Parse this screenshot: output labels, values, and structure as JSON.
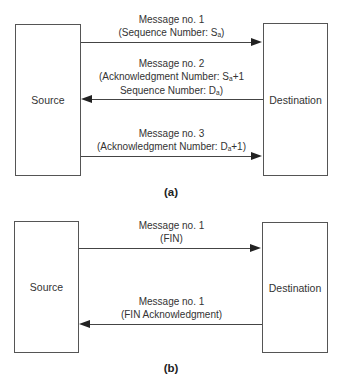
{
  "diagram_a": {
    "source_label": "Source",
    "destination_label": "Destination",
    "caption": "(a)",
    "messages": [
      {
        "direction": "source-to-destination",
        "title": "Message no. 1",
        "line2_prefix": "(Sequence Number: S",
        "line2_sub": "a",
        "line2_suffix": ")"
      },
      {
        "direction": "destination-to-source",
        "title": "Message no. 2",
        "line2_prefix": "(Acknowledgment Number: S",
        "line2_sub": "a",
        "line2_suffix": "+1",
        "line3_prefix": "Sequence Number: D",
        "line3_sub": "a",
        "line3_suffix": ")"
      },
      {
        "direction": "source-to-destination",
        "title": "Message no. 3",
        "line2_prefix": "(Acknowledgment Number: D",
        "line2_sub": "a",
        "line2_suffix": "+1)"
      }
    ]
  },
  "diagram_b": {
    "source_label": "Source",
    "destination_label": "Destination",
    "caption": "(b)",
    "messages": [
      {
        "direction": "source-to-destination",
        "title": "Message no. 1",
        "line2": "(FIN)"
      },
      {
        "direction": "destination-to-source",
        "title": "Message no. 1",
        "line2": "(FIN Acknowledgment)"
      }
    ]
  },
  "colors": {
    "line": "#444444",
    "box_border": "#555555",
    "text": "#333333"
  }
}
